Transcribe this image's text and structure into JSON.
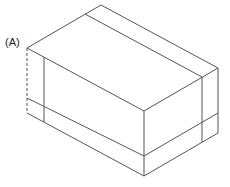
{
  "diagram": {
    "type": "isometric-box",
    "label_a": "(A)",
    "colors": {
      "stroke": "#555555",
      "background": "#ffffff",
      "label": "#222222"
    },
    "vertices": {
      "top_back": [
        101,
        5
      ],
      "top_left": [
        27,
        48
      ],
      "top_right": [
        218,
        68
      ],
      "top_front": [
        144,
        111
      ],
      "left_band": [
        27,
        98
      ],
      "left_bottom": [
        27,
        113
      ],
      "front_band": [
        144,
        156
      ],
      "front_bottom": [
        144,
        176
      ],
      "right_band": [
        218,
        113
      ],
      "right_bottom": [
        218,
        133
      ]
    }
  }
}
